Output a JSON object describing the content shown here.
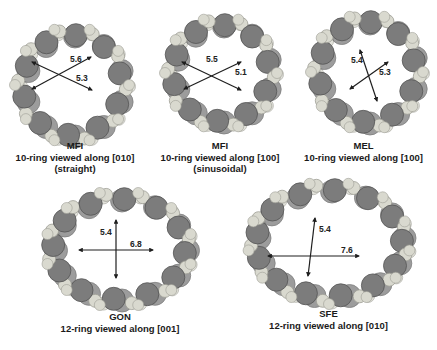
{
  "colors": {
    "atom_dark": "#7c7c7c",
    "atom_dark_edge": "#555555",
    "atom_light": "#d9d9cf",
    "atom_light_edge": "#9e9e96",
    "arrow": "#1e1e1e",
    "text": "#1a1a1a"
  },
  "panels": [
    {
      "id": "mfi-010",
      "framework": "MFI",
      "line1": "10-ring viewed along [010]",
      "line2": "(straight)",
      "dims": [
        {
          "label": "5.6"
        },
        {
          "label": "5.3"
        }
      ]
    },
    {
      "id": "mfi-100",
      "framework": "MFI",
      "line1": "10-ring viewed along [100]",
      "line2": "(sinusoidal)",
      "dims": [
        {
          "label": "5.5"
        },
        {
          "label": "5.1"
        }
      ]
    },
    {
      "id": "mel-100",
      "framework": "MEL",
      "line1": "10-ring viewed along [100]",
      "line2": "",
      "dims": [
        {
          "label": "5.4"
        },
        {
          "label": "5.3"
        }
      ]
    },
    {
      "id": "gon-001",
      "framework": "GON",
      "line1": "12-ring viewed along [001]",
      "line2": "",
      "dims": [
        {
          "label": "5.4"
        },
        {
          "label": "6.8"
        }
      ]
    },
    {
      "id": "sfe-010",
      "framework": "SFE",
      "line1": "12-ring viewed along [010]",
      "line2": "",
      "dims": [
        {
          "label": "5.4"
        },
        {
          "label": "7.6"
        }
      ]
    }
  ]
}
